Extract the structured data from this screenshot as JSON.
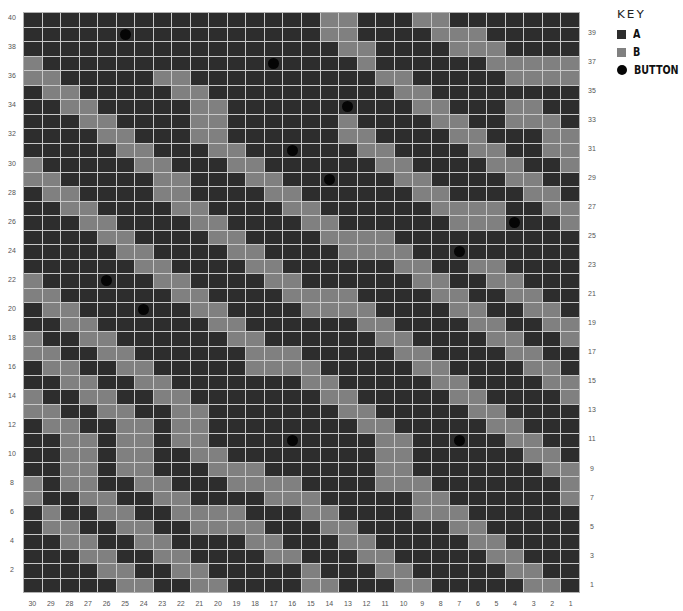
{
  "board": {
    "columns": 30,
    "rows": 40,
    "column_labels_left_to_right": [
      30,
      29,
      28,
      27,
      26,
      25,
      24,
      23,
      22,
      21,
      20,
      19,
      18,
      17,
      16,
      15,
      14,
      13,
      12,
      11,
      10,
      9,
      8,
      7,
      6,
      5,
      4,
      3,
      2,
      1
    ],
    "left_row_labels": [
      40,
      38,
      36,
      34,
      32,
      30,
      28,
      26,
      24,
      22,
      20,
      18,
      16,
      14,
      12,
      10,
      8,
      6,
      4,
      2
    ],
    "right_row_labels": [
      39,
      37,
      35,
      33,
      31,
      29,
      27,
      25,
      23,
      21,
      19,
      17,
      15,
      13,
      11,
      9,
      7,
      5,
      3,
      1
    ],
    "colors": {
      "A": "#2d2d2d",
      "B": "#808080",
      "button": "#050505",
      "gridline": "#c9c9c9"
    },
    "default_cell": "A",
    "b_cells_by_row": {
      "40": [
        16,
        17,
        21,
        22
      ],
      "39": [
        16,
        17,
        22,
        23,
        24
      ],
      "38": [
        17,
        18,
        23,
        24,
        25
      ],
      "37": [
        0,
        18,
        25,
        26,
        27,
        28,
        29
      ],
      "36": [
        0,
        1,
        7,
        8,
        19,
        20,
        26,
        27,
        28,
        29
      ],
      "35": [
        1,
        2,
        8,
        9,
        20,
        21
      ],
      "34": [
        2,
        3,
        9,
        10,
        21,
        22,
        26,
        27
      ],
      "33": [
        3,
        4,
        9,
        10,
        17,
        22,
        23,
        26,
        27,
        28
      ],
      "32": [
        4,
        5,
        9,
        10,
        17,
        18,
        23,
        24,
        28,
        29
      ],
      "31": [
        5,
        6,
        10,
        11,
        18,
        19,
        24,
        25,
        28,
        29
      ],
      "30": [
        0,
        6,
        7,
        11,
        12,
        19,
        20,
        25,
        26,
        29
      ],
      "29": [
        0,
        1,
        7,
        8,
        12,
        13,
        20,
        21,
        26,
        27
      ],
      "28": [
        1,
        2,
        7,
        8,
        13,
        14,
        21,
        22,
        27,
        28
      ],
      "27": [
        2,
        3,
        8,
        9,
        14,
        15,
        22,
        23,
        24,
        25,
        28,
        29
      ],
      "26": [
        3,
        4,
        9,
        10,
        15,
        16,
        23,
        24,
        25,
        29
      ],
      "25": [
        4,
        5,
        10,
        11,
        16,
        17,
        18,
        19
      ],
      "24": [
        5,
        6,
        11,
        12,
        17,
        18,
        19,
        20
      ],
      "23": [
        6,
        7,
        12,
        13,
        20,
        21,
        24,
        25
      ],
      "22": [
        0,
        7,
        8,
        13,
        14,
        21,
        22,
        25,
        26
      ],
      "21": [
        0,
        1,
        8,
        9,
        14,
        15,
        16,
        17,
        22,
        23,
        26,
        27
      ],
      "20": [
        1,
        2,
        9,
        10,
        15,
        16,
        17,
        18,
        23,
        24,
        27,
        28
      ],
      "19": [
        2,
        3,
        10,
        11,
        18,
        19,
        24,
        25,
        28,
        29
      ],
      "18": [
        0,
        3,
        4,
        11,
        12,
        19,
        20,
        25,
        26,
        29
      ],
      "17": [
        0,
        1,
        4,
        5,
        12,
        13,
        14,
        20,
        21,
        26,
        27
      ],
      "16": [
        1,
        2,
        5,
        6,
        12,
        13,
        14,
        15,
        21,
        22,
        27,
        28
      ],
      "15": [
        2,
        3,
        6,
        7,
        15,
        16,
        22,
        23,
        28,
        29
      ],
      "14": [
        0,
        3,
        4,
        7,
        8,
        16,
        17,
        23,
        24,
        29
      ],
      "13": [
        0,
        1,
        4,
        5,
        8,
        9,
        17,
        18,
        24,
        25
      ],
      "12": [
        1,
        2,
        5,
        6,
        8,
        9,
        18,
        19,
        25,
        26
      ],
      "11": [
        2,
        3,
        5,
        6,
        8,
        9,
        19,
        20,
        26,
        27
      ],
      "10": [
        2,
        3,
        5,
        6,
        9,
        10,
        19,
        20,
        27,
        28
      ],
      "9": [
        2,
        3,
        5,
        6,
        10,
        11,
        12,
        19,
        20,
        28,
        29
      ],
      "8": [
        0,
        2,
        3,
        6,
        7,
        11,
        12,
        13,
        14,
        19,
        20,
        21,
        29
      ],
      "7": [
        0,
        3,
        4,
        7,
        8,
        13,
        14,
        15,
        21,
        22,
        29
      ],
      "6": [
        1,
        4,
        5,
        8,
        9,
        10,
        11,
        15,
        16,
        21,
        22,
        23
      ],
      "5": [
        1,
        2,
        5,
        6,
        9,
        10,
        11,
        12,
        16,
        17,
        23,
        24
      ],
      "4": [
        2,
        3,
        6,
        7,
        12,
        13,
        17,
        18,
        24,
        25
      ],
      "3": [
        3,
        4,
        7,
        8,
        13,
        14,
        18,
        19,
        25,
        26
      ],
      "2": [
        4,
        5,
        8,
        9,
        15,
        19,
        20,
        26,
        27
      ],
      "1": [
        5,
        6,
        9,
        10,
        15,
        16,
        20,
        21,
        27,
        28
      ]
    },
    "buttons": [
      {
        "row": 39,
        "col": 25
      },
      {
        "row": 37,
        "col": 17
      },
      {
        "row": 34,
        "col": 13
      },
      {
        "row": 31,
        "col": 16
      },
      {
        "row": 29,
        "col": 14
      },
      {
        "row": 26,
        "col": 4
      },
      {
        "row": 24,
        "col": 7
      },
      {
        "row": 22,
        "col": 26
      },
      {
        "row": 20,
        "col": 24
      },
      {
        "row": 11,
        "col": 16
      },
      {
        "row": 11,
        "col": 7
      }
    ]
  },
  "key": {
    "title": "KEY",
    "items": [
      {
        "swatch": "A",
        "label": "A"
      },
      {
        "swatch": "B",
        "label": "B"
      },
      {
        "swatch": "BTN",
        "label": "BUTTON"
      }
    ]
  }
}
